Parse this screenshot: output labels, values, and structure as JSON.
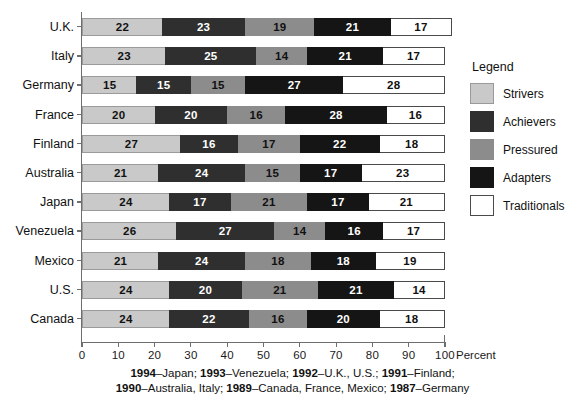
{
  "chart_data": {
    "type": "bar",
    "orientation": "horizontal",
    "stacked": true,
    "stack_mode": "percent",
    "title": "",
    "subtitle": "",
    "xlabel": "Percent",
    "ylabel": "",
    "xlim": [
      0,
      100
    ],
    "xticks": [
      0,
      10,
      20,
      30,
      40,
      50,
      60,
      70,
      80,
      90,
      100
    ],
    "xtick_labels": [
      "0",
      "10",
      "20",
      "30",
      "40",
      "50",
      "60",
      "70",
      "80",
      "90",
      "100"
    ],
    "grid": false,
    "legend_position": "right",
    "legend_title": "Legend",
    "categories": [
      "U.K.",
      "Italy",
      "Germany",
      "France",
      "Finland",
      "Australia",
      "Japan",
      "Venezuela",
      "Mexico",
      "U.S.",
      "Canada"
    ],
    "series": [
      {
        "name": "Strivers",
        "color": "#c9c9c9",
        "values": [
          22,
          23,
          15,
          20,
          27,
          21,
          24,
          26,
          21,
          24,
          24
        ]
      },
      {
        "name": "Achievers",
        "color": "#2f2f2f",
        "values": [
          23,
          25,
          15,
          20,
          16,
          24,
          17,
          27,
          24,
          20,
          22
        ]
      },
      {
        "name": "Pressured",
        "color": "#8c8c8c",
        "values": [
          19,
          14,
          15,
          16,
          17,
          15,
          21,
          14,
          18,
          21,
          16
        ]
      },
      {
        "name": "Adapters",
        "color": "#151515",
        "values": [
          21,
          21,
          27,
          28,
          22,
          17,
          17,
          16,
          18,
          21,
          20
        ]
      },
      {
        "name": "Traditionals",
        "color": "#ffffff",
        "values": [
          17,
          17,
          28,
          16,
          18,
          23,
          21,
          17,
          19,
          14,
          18
        ]
      }
    ],
    "annotations": [
      "1994–Japan; 1993–Venezuela; 1992–U.K., U.S.; 1991–Finland;",
      "1990–Australia, Italy; 1989–Canada, France, Mexico; 1987–Germany"
    ]
  },
  "footnote": {
    "lines": [
      [
        {
          "text": "1994",
          "bold": true
        },
        {
          "text": "–Japan; ",
          "bold": false
        },
        {
          "text": "1993",
          "bold": true
        },
        {
          "text": "–Venezuela; ",
          "bold": false
        },
        {
          "text": "1992",
          "bold": true
        },
        {
          "text": "–U.K., U.S.; ",
          "bold": false
        },
        {
          "text": "1991",
          "bold": true
        },
        {
          "text": "–Finland;",
          "bold": false
        }
      ],
      [
        {
          "text": "1990",
          "bold": true
        },
        {
          "text": "–Australia, Italy; ",
          "bold": false
        },
        {
          "text": "1989",
          "bold": true
        },
        {
          "text": "–Canada, France, Mexico; ",
          "bold": false
        },
        {
          "text": "1987",
          "bold": true
        },
        {
          "text": "–Germany",
          "bold": false
        }
      ]
    ]
  }
}
